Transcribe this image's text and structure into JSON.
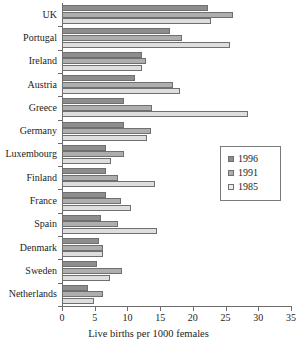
{
  "chart_data": {
    "type": "bar",
    "orientation": "horizontal",
    "title": "",
    "xlabel": "Live births per 1000 females",
    "ylabel": "",
    "xlim": [
      0,
      35
    ],
    "xticks": [
      0,
      5,
      10,
      15,
      20,
      25,
      30,
      35
    ],
    "grid": false,
    "legend_position": "right",
    "categories": [
      "UK",
      "Portugal",
      "Ireland",
      "Austria",
      "Greece",
      "Germany",
      "Luxembourg",
      "Finland",
      "France",
      "Spain",
      "Denmark",
      "Sweden",
      "Netherlands"
    ],
    "series": [
      {
        "name": "1996",
        "color": "#8d8d8d",
        "values": [
          22.3,
          16.5,
          12.2,
          11.2,
          9.5,
          9.5,
          6.7,
          6.7,
          6.7,
          6.0,
          5.6,
          5.4,
          4.0
        ]
      },
      {
        "name": "1991",
        "color": "#aeaeae",
        "values": [
          26.1,
          18.3,
          12.8,
          17.0,
          13.8,
          13.6,
          9.5,
          8.6,
          9.0,
          8.5,
          6.3,
          9.1,
          6.2
        ]
      },
      {
        "name": "1985",
        "color": "#dedede",
        "values": [
          22.8,
          25.7,
          12.2,
          18.0,
          28.4,
          13.0,
          7.5,
          14.2,
          10.6,
          14.5,
          6.3,
          7.3,
          4.9
        ]
      }
    ]
  },
  "legend": {
    "entries": [
      {
        "label": "1996",
        "swatch": "dark-gray-swatch"
      },
      {
        "label": "1991",
        "swatch": "medium-gray-swatch"
      },
      {
        "label": "1985",
        "swatch": "light-gray-swatch"
      }
    ]
  }
}
